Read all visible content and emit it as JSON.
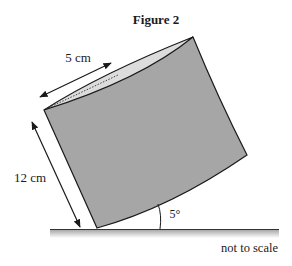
{
  "figure": {
    "title": "Figure 2",
    "labels": {
      "diameter": "5 cm",
      "height": "12 cm",
      "angle": "5°",
      "note": "not to scale"
    },
    "quantities": {
      "diameter_cm": 5,
      "height_cm": 12,
      "tilt_angle_deg": 5
    },
    "colors": {
      "body_fill": "#a6a6a6",
      "top_fill": "#dcdcdc",
      "stroke": "#1a1a1a",
      "ground_shadow": "#bdbdbd"
    }
  }
}
